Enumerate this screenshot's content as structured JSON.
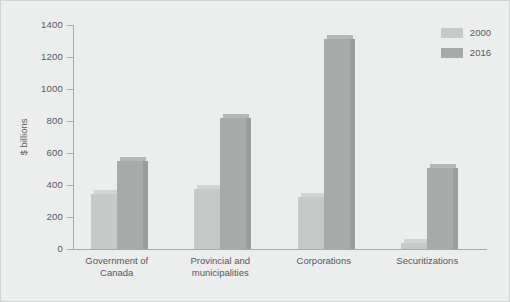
{
  "chart_data": {
    "type": "bar",
    "title": "",
    "xlabel": "",
    "ylabel": "$ billions",
    "ylim": [
      0,
      1400
    ],
    "ytick_step": 200,
    "yticks": [
      1400,
      1200,
      1000,
      800,
      600,
      400,
      200,
      0
    ],
    "ytick_labels": [
      "1400",
      "1200",
      "1000",
      "800",
      "600",
      "400",
      "200",
      "0"
    ],
    "grid": false,
    "legend_position": "top-right",
    "categories": [
      "Government of\nCanada",
      "Provincial and\nmunicipalities",
      "Corporations",
      "Securitizations"
    ],
    "category_lines": [
      [
        "Government of",
        "Canada"
      ],
      [
        "Provincial and",
        "municipalities"
      ],
      [
        "Corporations",
        ""
      ],
      [
        "Securitizations",
        ""
      ]
    ],
    "series": [
      {
        "name": "2000",
        "color": "#c7c8c8",
        "values": [
          345,
          375,
          325,
          40
        ]
      },
      {
        "name": "2016",
        "color": "#a8aaaa",
        "values": [
          550,
          820,
          1310,
          505
        ]
      }
    ]
  },
  "legend": {
    "items": [
      {
        "label": "2000"
      },
      {
        "label": "2016"
      }
    ]
  },
  "colors": {
    "background": "#eceded",
    "border": "#d2d4d4",
    "axis": "#a9abab",
    "text": "#58595b",
    "series_2000": "#c7c8c8",
    "series_2016": "#a8aaaa"
  }
}
